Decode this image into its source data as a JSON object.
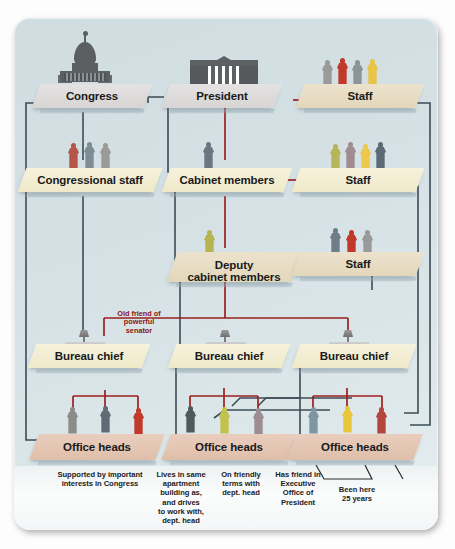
{
  "diagram": {
    "colors": {
      "card_bg": "#d4e0e4",
      "solid_line": "#3a4a52",
      "informal_line": "#9c1f1f",
      "slab_gray": "#ded9d8",
      "slab_cream": "#f2eccf",
      "slab_tan": "#e7dcc2",
      "slab_pink": "#e4c4b2"
    },
    "nodes": [
      {
        "id": "congress",
        "label": "Congress",
        "icon": "capitol-icon"
      },
      {
        "id": "president",
        "label": "President",
        "icon": "white-house-icon"
      },
      {
        "id": "staff-top",
        "label": "Staff",
        "icon": "people-icon"
      },
      {
        "id": "congressional-staff",
        "label": "Congressional staff",
        "icon": "people-icon"
      },
      {
        "id": "cabinet-members",
        "label": "Cabinet members",
        "icon": "people-icon"
      },
      {
        "id": "staff-mid",
        "label": "Staff",
        "icon": "people-icon"
      },
      {
        "id": "deputy-cabinet",
        "label": "Deputy\ncabinet members",
        "icon": "people-icon"
      },
      {
        "id": "staff-low",
        "label": "Staff",
        "icon": "people-icon"
      },
      {
        "id": "bureau-chief-1",
        "label": "Bureau chief",
        "icon": "desk-icon"
      },
      {
        "id": "bureau-chief-2",
        "label": "Bureau chief",
        "icon": "desk-icon"
      },
      {
        "id": "bureau-chief-3",
        "label": "Bureau chief",
        "icon": "desk-icon"
      },
      {
        "id": "office-heads-1",
        "label": "Office heads",
        "icon": "people-icon"
      },
      {
        "id": "office-heads-2",
        "label": "Office heads",
        "icon": "people-icon"
      },
      {
        "id": "office-heads-3",
        "label": "Office heads",
        "icon": "people-icon"
      }
    ],
    "labels": {
      "congress": "Congress",
      "president": "President",
      "staff_top": "Staff",
      "congressional_staff": "Congressional staff",
      "cabinet_members": "Cabinet members",
      "staff_mid": "Staff",
      "deputy_line1": "Deputy",
      "deputy_line2": "cabinet members",
      "staff_low": "Staff",
      "bureau_chief_1": "Bureau chief",
      "bureau_chief_2": "Bureau chief",
      "bureau_chief_3": "Bureau chief",
      "office_heads_1": "Office heads",
      "office_heads_2": "Office heads",
      "office_heads_3": "Office heads"
    },
    "annotations": {
      "old_friend": "Old friend of\npowerful\nsenator",
      "supported_by": "Supported by important\ninterests in Congress",
      "lives_in_same": "Lives in same\napartment\nbuilding as,\nand drives\nto work with,\ndept. head",
      "on_friendly": "On friendly\nterms with\ndept. head",
      "has_friend": "Has friend in\nExecutive\nOffice of\nPresident",
      "been_here": "Been here\n25 years"
    },
    "figures": {
      "staff_top": [
        "#9a9a9a",
        "#c0392b",
        "#8d9499",
        "#e8c547"
      ],
      "congressional_staff": [
        "#b4564a",
        "#7e8d95",
        "#9a9a98"
      ],
      "staff_mid": [
        "#b6b559",
        "#9f8c91",
        "#edc84a",
        "#5c6a73"
      ],
      "cabinet_members": [
        "#6b7780"
      ],
      "deputy_cabinet": [
        "#b5b44e"
      ],
      "staff_low": [
        "#6e7d88",
        "#c0392b",
        "#9a9a9a"
      ],
      "office_heads_1": [
        "#8b8b88",
        "#5d6b74",
        "#c0392b"
      ],
      "office_heads_2": [
        "#4f5a5f",
        "#c2c24e",
        "#9d8d92"
      ],
      "office_heads_3": [
        "#7e96a0",
        "#e8c63c",
        "#b4453c"
      ]
    }
  }
}
